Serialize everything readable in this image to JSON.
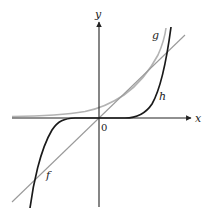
{
  "figure": {
    "type": "function-graph",
    "axes": {
      "x_label": "x",
      "y_label": "y",
      "origin_label": "0"
    },
    "curves": [
      {
        "name": "f",
        "label": "f",
        "description": "straight line through origin",
        "color": "#9a9a9a"
      },
      {
        "name": "g",
        "label": "g",
        "description": "exponential-like curve, asymptotic to x-axis on left",
        "color": "#b3b3b3"
      },
      {
        "name": "h",
        "label": "h",
        "description": "odd power curve, flat near origin, steep at ends",
        "color": "#1a1a1a"
      }
    ],
    "colors": {
      "axis": "#222222",
      "f": "#9a9a9a",
      "g": "#b3b3b3",
      "h": "#1a1a1a",
      "background": "#ffffff"
    }
  }
}
